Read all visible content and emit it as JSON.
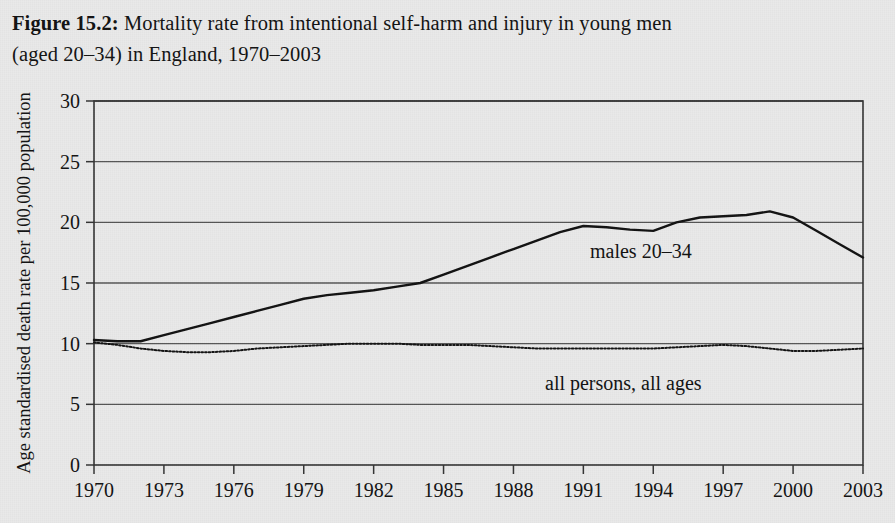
{
  "figure": {
    "label": "Figure 15.2:",
    "caption_line1": " Mortality rate from intentional self-harm and injury in young men",
    "caption_line2": "(aged 20–34) in England, 1970–2003"
  },
  "colors": {
    "page_background": "#e9e9e9",
    "ink": "#111111",
    "gridline": "#555555",
    "axis": "#333333"
  },
  "chart_data": {
    "type": "line",
    "title": "Mortality rate from intentional self-harm and injury in young men (aged 20–34) in England, 1970–2003",
    "xlabel": "",
    "ylabel": "Age standardised death rate per 100,000 population",
    "xlim": [
      1970,
      2003
    ],
    "ylim": [
      0,
      30
    ],
    "grid": "horizontal",
    "legend_position": "inline-annotations",
    "x_tick_labels": [
      "1970",
      "1973",
      "1976",
      "1979",
      "1982",
      "1985",
      "1988",
      "1991",
      "1994",
      "1997",
      "2000",
      "2003"
    ],
    "x_ticks": [
      1970,
      1973,
      1976,
      1979,
      1982,
      1985,
      1988,
      1991,
      1994,
      1997,
      2000,
      2003
    ],
    "y_tick_labels": [
      "0",
      "5",
      "10",
      "15",
      "20",
      "25",
      "30"
    ],
    "y_ticks": [
      0,
      5,
      10,
      15,
      20,
      25,
      30
    ],
    "x": [
      1970,
      1971,
      1972,
      1973,
      1974,
      1975,
      1976,
      1977,
      1978,
      1979,
      1980,
      1981,
      1982,
      1983,
      1984,
      1985,
      1986,
      1987,
      1988,
      1989,
      1990,
      1991,
      1992,
      1993,
      1994,
      1995,
      1996,
      1997,
      1998,
      1999,
      2000,
      2001,
      2002,
      2003
    ],
    "series": [
      {
        "name": "males 20–34",
        "style": "solid",
        "annotation": "males 20–34",
        "values": [
          10.3,
          10.2,
          10.2,
          10.7,
          11.2,
          11.7,
          12.2,
          12.7,
          13.2,
          13.7,
          14.0,
          14.2,
          14.4,
          14.7,
          15.0,
          15.7,
          16.4,
          17.1,
          17.8,
          18.5,
          19.2,
          19.7,
          19.6,
          19.4,
          19.3,
          20.0,
          20.4,
          20.5,
          20.6,
          20.9,
          20.4,
          19.3,
          18.2,
          17.1
        ]
      },
      {
        "name": "all persons, all ages",
        "style": "dotted",
        "annotation": "all persons, all ages",
        "values": [
          10.1,
          9.9,
          9.6,
          9.4,
          9.3,
          9.3,
          9.4,
          9.6,
          9.7,
          9.8,
          9.9,
          10.0,
          10.0,
          10.0,
          9.9,
          9.9,
          9.9,
          9.8,
          9.7,
          9.6,
          9.6,
          9.6,
          9.6,
          9.6,
          9.6,
          9.7,
          9.8,
          9.9,
          9.8,
          9.6,
          9.4,
          9.4,
          9.5,
          9.6
        ]
      }
    ]
  }
}
